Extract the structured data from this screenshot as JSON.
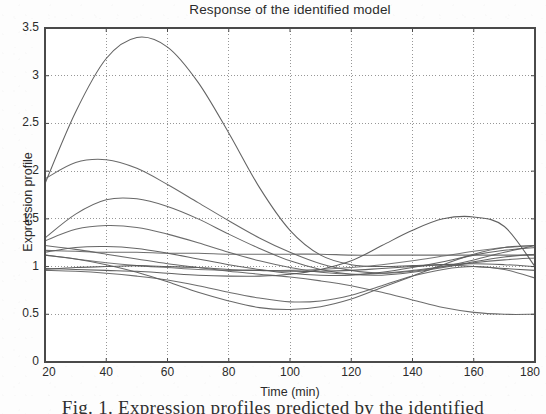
{
  "figure": {
    "title": "Response of the identified model",
    "caption": "Fig. 1. Expression profiles predicted by the identified",
    "background_color": "#fdfdfd",
    "axis_color": "#4a4a4a",
    "grid_color": "#8c8c8c",
    "curve_color": "#555555"
  },
  "chart_data": {
    "type": "line",
    "title": "Response of the identified model",
    "xlabel": "Time (min)",
    "ylabel": "Expression profile",
    "xlim": [
      20,
      180
    ],
    "ylim": [
      0,
      3.5
    ],
    "xticks": [
      20,
      40,
      60,
      80,
      100,
      120,
      140,
      160,
      180
    ],
    "xtick_labels": [
      "20",
      "40",
      "60",
      "80",
      "100",
      "120",
      "140",
      "160",
      "180"
    ],
    "yticks": [
      0,
      0.5,
      1,
      1.5,
      2,
      2.5,
      3,
      3.5
    ],
    "ytick_labels": [
      "0",
      "0.5",
      "1",
      "1.5",
      "2",
      "2.5",
      "3",
      "3.5"
    ],
    "grid": true,
    "grid_style": "dotted",
    "legend": false,
    "x": [
      20,
      30,
      40,
      50,
      60,
      70,
      80,
      90,
      100,
      110,
      120,
      130,
      140,
      150,
      160,
      170,
      180
    ],
    "series": [
      {
        "name": "gene-1",
        "color": "#555555",
        "values": [
          1.87,
          2.62,
          3.18,
          3.4,
          3.3,
          2.93,
          2.4,
          1.83,
          1.38,
          1.12,
          1.02,
          1.0,
          1.01,
          1.02,
          1.0,
          0.98,
          0.96
        ]
      },
      {
        "name": "gene-2",
        "color": "#5d5d5d",
        "values": [
          1.92,
          2.09,
          2.12,
          2.03,
          1.86,
          1.67,
          1.48,
          1.3,
          1.15,
          1.03,
          0.96,
          0.93,
          0.95,
          1.0,
          1.07,
          1.15,
          1.22
        ]
      },
      {
        "name": "gene-3",
        "color": "#5a5a5a",
        "values": [
          1.3,
          1.55,
          1.7,
          1.71,
          1.63,
          1.5,
          1.34,
          1.19,
          1.06,
          0.97,
          0.92,
          0.91,
          0.94,
          0.99,
          1.05,
          1.1,
          1.13
        ]
      },
      {
        "name": "gene-4",
        "color": "#606060",
        "values": [
          1.27,
          1.39,
          1.43,
          1.41,
          1.34,
          1.25,
          1.15,
          1.06,
          0.99,
          0.94,
          0.92,
          0.93,
          0.96,
          1.0,
          1.04,
          1.07,
          1.09
        ]
      },
      {
        "name": "gene-5",
        "color": "#585858",
        "values": [
          1.15,
          1.2,
          1.21,
          1.19,
          1.14,
          1.08,
          1.02,
          0.97,
          0.93,
          0.91,
          0.91,
          0.94,
          0.99,
          1.05,
          1.12,
          1.17,
          1.2
        ]
      },
      {
        "name": "gene-6",
        "color": "#626262",
        "values": [
          1.17,
          1.16,
          1.15,
          1.15,
          1.14,
          1.14,
          1.13,
          1.13,
          1.13,
          1.13,
          1.12,
          1.12,
          1.12,
          1.12,
          1.12,
          1.12,
          1.12
        ]
      },
      {
        "name": "gene-7",
        "color": "#6b6b6b",
        "values": [
          1.12,
          1.08,
          1.04,
          1.01,
          0.99,
          0.97,
          0.96,
          0.96,
          0.96,
          0.97,
          0.99,
          1.02,
          1.06,
          1.11,
          1.16,
          1.2,
          1.22
        ]
      },
      {
        "name": "gene-8",
        "color": "#565656",
        "values": [
          0.97,
          0.99,
          1.0,
          1.01,
          1.0,
          0.99,
          0.97,
          0.96,
          0.95,
          0.95,
          0.96,
          0.98,
          1.0,
          1.02,
          1.03,
          1.02,
          1.0
        ]
      },
      {
        "name": "gene-9",
        "color": "#525252",
        "values": [
          0.98,
          0.97,
          0.96,
          0.95,
          0.93,
          0.91,
          0.9,
          0.9,
          0.92,
          0.97,
          1.06,
          1.22,
          1.38,
          1.5,
          1.52,
          1.42,
          1.0
        ]
      },
      {
        "name": "gene-10",
        "color": "#5f5f5f",
        "values": [
          0.96,
          0.95,
          0.93,
          0.9,
          0.86,
          0.8,
          0.73,
          0.67,
          0.63,
          0.64,
          0.7,
          0.8,
          0.9,
          0.97,
          1.0,
          0.97,
          0.88
        ]
      },
      {
        "name": "gene-11",
        "color": "#5b5b5b",
        "values": [
          1.12,
          1.08,
          1.02,
          0.94,
          0.84,
          0.73,
          0.64,
          0.57,
          0.55,
          0.58,
          0.66,
          0.78,
          0.9,
          1.02,
          1.13,
          1.2,
          1.22
        ]
      },
      {
        "name": "gene-12",
        "color": "#606060",
        "values": [
          1.22,
          1.18,
          1.13,
          1.08,
          1.03,
          0.99,
          0.95,
          0.92,
          0.89,
          0.85,
          0.8,
          0.73,
          0.65,
          0.57,
          0.52,
          0.5,
          0.5
        ]
      }
    ]
  }
}
